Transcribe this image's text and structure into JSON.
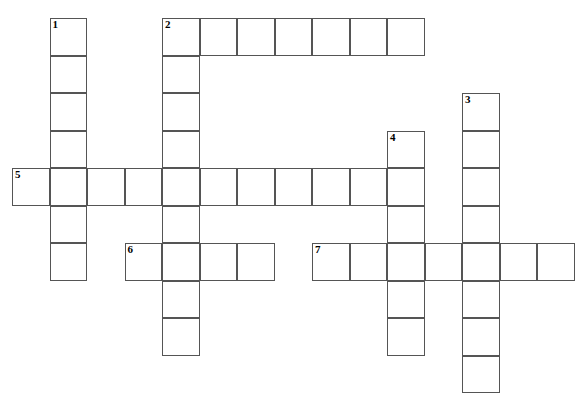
{
  "puzzle": {
    "title": "Crossword Puzzle Grid",
    "grid": {
      "cell_size": 37.5,
      "origin_x": 12,
      "origin_y": 18,
      "columns": 15,
      "rows": 10,
      "border_color": "#555555",
      "cell_fill": "#ffffff",
      "page_background": "#ffffff",
      "number_color": "#000000"
    },
    "entries": [
      {
        "number": "1",
        "direction": "down",
        "col": 1,
        "row": 0,
        "length": 7
      },
      {
        "number": "2",
        "direction": "across",
        "col": 4,
        "row": 0,
        "length": 7
      },
      {
        "number": "2",
        "direction": "down",
        "col": 4,
        "row": 0,
        "length": 9
      },
      {
        "number": "3",
        "direction": "down",
        "col": 12,
        "row": 2,
        "length": 8
      },
      {
        "number": "4",
        "direction": "down",
        "col": 10,
        "row": 3,
        "length": 6
      },
      {
        "number": "5",
        "direction": "across",
        "col": 0,
        "row": 4,
        "length": 11
      },
      {
        "number": "6",
        "direction": "across",
        "col": 3,
        "row": 6,
        "length": 4
      },
      {
        "number": "7",
        "direction": "across",
        "col": 8,
        "row": 6,
        "length": 7
      }
    ],
    "numbered_cells": [
      {
        "number": "1",
        "col": 1,
        "row": 0
      },
      {
        "number": "2",
        "col": 4,
        "row": 0
      },
      {
        "number": "3",
        "col": 12,
        "row": 2
      },
      {
        "number": "4",
        "col": 10,
        "row": 3
      },
      {
        "number": "5",
        "col": 0,
        "row": 4
      },
      {
        "number": "6",
        "col": 3,
        "row": 6
      },
      {
        "number": "7",
        "col": 8,
        "row": 6
      }
    ],
    "cells": [
      {
        "col": 1,
        "row": 0
      },
      {
        "col": 1,
        "row": 1
      },
      {
        "col": 1,
        "row": 2
      },
      {
        "col": 1,
        "row": 3
      },
      {
        "col": 1,
        "row": 4
      },
      {
        "col": 1,
        "row": 5
      },
      {
        "col": 1,
        "row": 6
      },
      {
        "col": 4,
        "row": 0
      },
      {
        "col": 5,
        "row": 0
      },
      {
        "col": 6,
        "row": 0
      },
      {
        "col": 7,
        "row": 0
      },
      {
        "col": 8,
        "row": 0
      },
      {
        "col": 9,
        "row": 0
      },
      {
        "col": 10,
        "row": 0
      },
      {
        "col": 4,
        "row": 1
      },
      {
        "col": 4,
        "row": 2
      },
      {
        "col": 4,
        "row": 3
      },
      {
        "col": 4,
        "row": 4
      },
      {
        "col": 4,
        "row": 5
      },
      {
        "col": 4,
        "row": 6
      },
      {
        "col": 4,
        "row": 7
      },
      {
        "col": 4,
        "row": 8
      },
      {
        "col": 12,
        "row": 2
      },
      {
        "col": 12,
        "row": 3
      },
      {
        "col": 12,
        "row": 4
      },
      {
        "col": 12,
        "row": 5
      },
      {
        "col": 12,
        "row": 6
      },
      {
        "col": 12,
        "row": 7
      },
      {
        "col": 12,
        "row": 8
      },
      {
        "col": 12,
        "row": 9
      },
      {
        "col": 10,
        "row": 3
      },
      {
        "col": 10,
        "row": 4
      },
      {
        "col": 10,
        "row": 5
      },
      {
        "col": 10,
        "row": 6
      },
      {
        "col": 10,
        "row": 7
      },
      {
        "col": 10,
        "row": 8
      },
      {
        "col": 0,
        "row": 4
      },
      {
        "col": 1,
        "row": 4
      },
      {
        "col": 2,
        "row": 4
      },
      {
        "col": 3,
        "row": 4
      },
      {
        "col": 4,
        "row": 4
      },
      {
        "col": 5,
        "row": 4
      },
      {
        "col": 6,
        "row": 4
      },
      {
        "col": 7,
        "row": 4
      },
      {
        "col": 8,
        "row": 4
      },
      {
        "col": 9,
        "row": 4
      },
      {
        "col": 10,
        "row": 4
      },
      {
        "col": 3,
        "row": 6
      },
      {
        "col": 4,
        "row": 6
      },
      {
        "col": 5,
        "row": 6
      },
      {
        "col": 6,
        "row": 6
      },
      {
        "col": 8,
        "row": 6
      },
      {
        "col": 9,
        "row": 6
      },
      {
        "col": 10,
        "row": 6
      },
      {
        "col": 11,
        "row": 6
      },
      {
        "col": 12,
        "row": 6
      },
      {
        "col": 13,
        "row": 6
      },
      {
        "col": 14,
        "row": 6
      }
    ]
  }
}
